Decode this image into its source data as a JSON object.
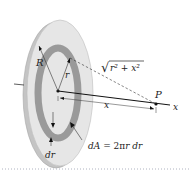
{
  "diagram": {
    "type": "physics-disk-field",
    "labels": {
      "R": "R",
      "r": "r",
      "distance_sqrt": "√",
      "distance_expr": "r² + x²",
      "x_dist": "x",
      "P": "P",
      "x_axis": "x",
      "dA_lhs": "dA",
      "dA_eq": " = 2π",
      "dA_rhs": "r dr",
      "dr": "dr"
    },
    "colors": {
      "disk_face": "#e6e6e6",
      "disk_edge": "#c4c4c4",
      "ring": "#9a9a9a",
      "line": "#222222",
      "dotted_rule": "#9aa0b0"
    }
  }
}
